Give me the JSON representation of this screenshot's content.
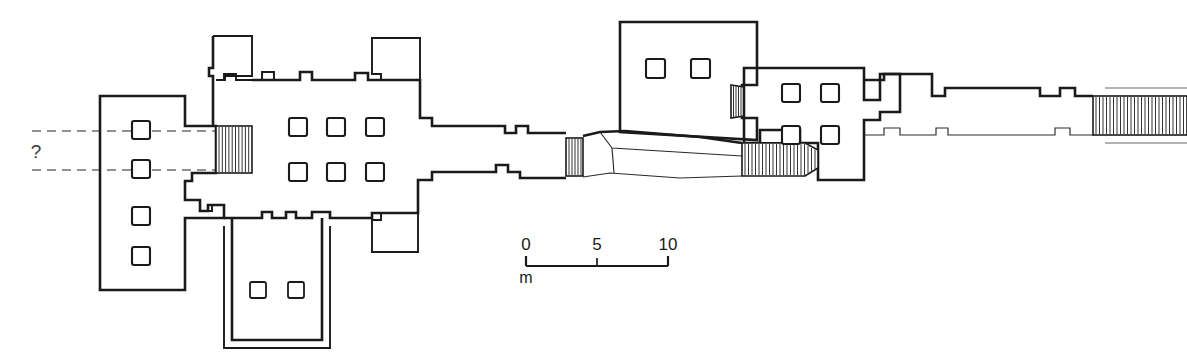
{
  "figure": {
    "kind": "archaeological-floor-plan",
    "orientation": "horizontal-axial",
    "background_color": "#ffffff",
    "line_color": "#1a1a1a",
    "dash_color": "#6e6e6e"
  },
  "annotations": {
    "query_label": "?",
    "query_meaning": "uncertain-extent-of-structure-to-the-west"
  },
  "scale_bar": {
    "unit_label": "m",
    "tick_labels": [
      "0",
      "5",
      "10"
    ],
    "tick_values": [
      0,
      5,
      10
    ],
    "bar_x_start": 526,
    "bar_x_end": 668,
    "bar_y": 264,
    "pixels_per_unit": 14.2
  },
  "rooms": [
    {
      "id": "west-hall",
      "name": "west-columned-hall",
      "column_count": 4,
      "columns": [
        {
          "cx": 141,
          "cy": 130
        },
        {
          "cx": 141,
          "cy": 169
        },
        {
          "cx": 141,
          "cy": 216
        },
        {
          "cx": 141,
          "cy": 256
        }
      ]
    },
    {
      "id": "hypostyle-hall",
      "name": "central-hypostyle-hall",
      "column_count": 6,
      "columns": [
        {
          "cx": 298,
          "cy": 127
        },
        {
          "cx": 336,
          "cy": 127
        },
        {
          "cx": 375,
          "cy": 127
        },
        {
          "cx": 298,
          "cy": 172
        },
        {
          "cx": 336,
          "cy": 172
        },
        {
          "cx": 375,
          "cy": 172
        }
      ]
    },
    {
      "id": "south-court",
      "name": "south-peristyle-court",
      "column_count": 2,
      "columns": [
        {
          "cx": 258,
          "cy": 290
        },
        {
          "cx": 296,
          "cy": 290
        }
      ]
    },
    {
      "id": "north-chamber",
      "name": "north-columned-chamber",
      "column_count": 2,
      "columns": [
        {
          "cx": 655,
          "cy": 68
        },
        {
          "cx": 700,
          "cy": 68
        }
      ]
    },
    {
      "id": "east-chamber",
      "name": "east-columned-chamber",
      "column_count": 4,
      "columns": [
        {
          "cx": 791,
          "cy": 93
        },
        {
          "cx": 830,
          "cy": 93
        },
        {
          "cx": 791,
          "cy": 135
        },
        {
          "cx": 830,
          "cy": 135
        }
      ]
    },
    {
      "id": "north-annex",
      "name": "north-annex-room",
      "column_count": 0,
      "columns": []
    },
    {
      "id": "north-east-annex",
      "name": "north-east-annex-room",
      "column_count": 0,
      "columns": []
    },
    {
      "id": "south-east-annex",
      "name": "south-east-annex-room",
      "column_count": 0,
      "columns": []
    }
  ],
  "hatched_features": [
    {
      "id": "west-gate",
      "name": "west-gateway-ramp",
      "x": 216,
      "y": 126,
      "w": 36,
      "h": 47,
      "lines": 11
    },
    {
      "id": "corridor-gate",
      "name": "corridor-gateway",
      "x": 566,
      "y": 140,
      "w": 16,
      "h": 35,
      "lines": 6
    },
    {
      "id": "chamber-gate",
      "name": "chamber-doorway",
      "x": 731,
      "y": 85,
      "w": 13,
      "h": 33,
      "lines": 6
    },
    {
      "id": "grand-stair",
      "name": "grand-staircase",
      "x": 742,
      "y": 143,
      "w": 76,
      "h": 32,
      "lines": 26
    },
    {
      "id": "east-stair",
      "name": "east-terminal-staircase",
      "x": 1093,
      "y": 96,
      "w": 94,
      "h": 39,
      "lines": 31
    }
  ],
  "axis_lines": [
    {
      "id": "axis-upper",
      "y": 131,
      "x_start": 32,
      "x_end": 218
    },
    {
      "id": "axis-lower",
      "y": 170,
      "x_start": 32,
      "x_end": 218
    }
  ]
}
